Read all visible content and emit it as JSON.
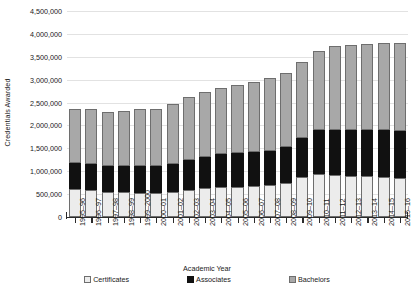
{
  "chart_data": {
    "type": "bar",
    "stacked": true,
    "title": "",
    "xlabel": "Academic Year",
    "ylabel": "Credentials Awarded",
    "ylim": [
      0,
      4500000
    ],
    "ytick_step": 500000,
    "grid": true,
    "legend_position": "bottom",
    "yticks": [
      "0",
      "500,000",
      "1,000,000",
      "1,500,000",
      "2,000,000",
      "2,500,000",
      "3,000,000",
      "3,500,000",
      "4,000,000",
      "4,500,000"
    ],
    "ytick_values": [
      0,
      500000,
      1000000,
      1500000,
      2000000,
      2500000,
      3000000,
      3500000,
      4000000,
      4500000
    ],
    "categories": [
      "1995–96",
      "1996–97",
      "1997–98",
      "1998–99",
      "1999–2000",
      "2000–01",
      "2001–02",
      "2002–03",
      "2003–04",
      "2004–05",
      "2005–06",
      "2006–07",
      "2007–08",
      "2008–09",
      "2009–10",
      "2010–11",
      "2011–12",
      "2012–13",
      "2013–14",
      "2014–15",
      "2015–16"
    ],
    "series": [
      {
        "name": "Certificates",
        "color": "#ececec",
        "values": [
          610000,
          580000,
          540000,
          540000,
          530000,
          525000,
          555000,
          600000,
          640000,
          650000,
          655000,
          670000,
          690000,
          735000,
          870000,
          950000,
          910000,
          890000,
          890000,
          870000,
          855000
        ]
      },
      {
        "name": "Associates",
        "color": "#111111",
        "values": [
          580000,
          585000,
          580000,
          570000,
          575000,
          585000,
          600000,
          650000,
          670000,
          730000,
          735000,
          745000,
          760000,
          795000,
          860000,
          950000,
          1000000,
          1015000,
          1015000,
          1030000,
          1025000
        ]
      },
      {
        "name": "Bachelors",
        "color": "#a8a8a8",
        "values": [
          1160000,
          1185000,
          1170000,
          1200000,
          1245000,
          1255000,
          1305000,
          1370000,
          1415000,
          1440000,
          1485000,
          1535000,
          1580000,
          1625000,
          1655000,
          1730000,
          1835000,
          1850000,
          1880000,
          1905000,
          1920000
        ]
      }
    ],
    "totals": [
      2350000,
      2350000,
      2290000,
      2310000,
      2350000,
      2365000,
      2460000,
      2620000,
      2725000,
      2820000,
      2875000,
      2950000,
      3030000,
      3155000,
      3385000,
      3630000,
      3745000,
      3755000,
      3785000,
      3805000,
      3800000
    ]
  },
  "legend": [
    {
      "label": "Certificates",
      "color": "#ececec"
    },
    {
      "label": "Associates",
      "color": "#111111"
    },
    {
      "label": "Bachelors",
      "color": "#a8a8a8"
    }
  ]
}
